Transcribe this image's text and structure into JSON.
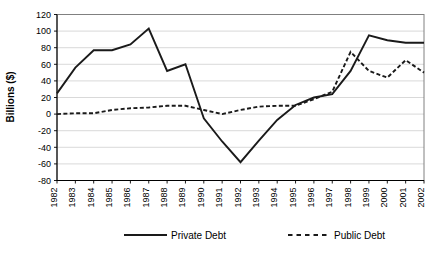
{
  "chart_data": {
    "type": "line",
    "title": "",
    "xlabel": "",
    "ylabel": "Billions ($)",
    "ylim": [
      -80,
      120
    ],
    "ytick_step": 20,
    "yticks": [
      120,
      100,
      80,
      60,
      40,
      20,
      0,
      -20,
      -40,
      -60,
      -80
    ],
    "ytick_labels": [
      "120",
      "100",
      "80",
      "60",
      "40",
      "20",
      "0",
      "-20",
      "-40",
      "-60",
      "-80"
    ],
    "grid": true,
    "grid_axis": "y",
    "legend_position": "bottom",
    "categories": [
      "1982",
      "1983",
      "1984",
      "1985",
      "1986",
      "1987",
      "1988",
      "1989",
      "1990",
      "1991",
      "1992",
      "1993",
      "1994",
      "1995",
      "1996",
      "1997",
      "1998",
      "1999",
      "2000",
      "2001",
      "2002"
    ],
    "series": [
      {
        "name": "Private Debt",
        "style": "solid",
        "color": "#1a1a1a",
        "values": [
          25,
          56,
          77,
          77,
          84,
          103,
          52,
          60,
          -5,
          -33,
          -58,
          -32,
          -7,
          11,
          20,
          24,
          52,
          95,
          89,
          86,
          86
        ]
      },
      {
        "name": "Public Debt",
        "style": "dashed",
        "color": "#1a1a1a",
        "values": [
          0,
          1,
          1,
          5,
          7,
          8,
          10,
          10,
          5,
          0,
          5,
          9,
          10,
          10,
          18,
          27,
          75,
          52,
          44,
          65,
          50
        ]
      }
    ]
  },
  "legend": {
    "items": [
      {
        "label": "Private Debt",
        "style": "solid"
      },
      {
        "label": "Public Debt",
        "style": "dashed"
      }
    ]
  }
}
